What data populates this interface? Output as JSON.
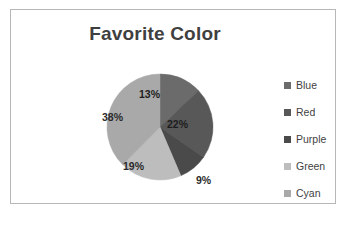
{
  "chart_data": {
    "type": "pie",
    "title": "Favorite Color",
    "categories": [
      "Blue",
      "Red",
      "Purple",
      "Green",
      "Cyan"
    ],
    "values": [
      13,
      22,
      9,
      19,
      38
    ],
    "value_labels": [
      "13%",
      "22%",
      "9%",
      "19%",
      "38%"
    ],
    "unit": "percent",
    "start_angle_deg": 0,
    "direction": "clockwise",
    "legend_position": "right",
    "grid": false,
    "colors": [
      "#6b6b6b",
      "#585858",
      "#4a4a4a",
      "#bdbdbd",
      "#a9a9a9"
    ],
    "label_colors": [
      "#1d1d1d",
      "#1d1d1d",
      "#2b2b2b",
      "#2b2b2b",
      "#2b2b2b"
    ]
  },
  "chart": {
    "title": "Favorite Color",
    "border_color": "#b7b7b7",
    "background": "#ffffff",
    "title_color": "#3f3f3f"
  },
  "legend": {
    "items": [
      {
        "label": "Blue",
        "color": "#6b6b6b",
        "swatch_name": "legend-swatch-blue"
      },
      {
        "label": "Red",
        "color": "#585858",
        "swatch_name": "legend-swatch-red"
      },
      {
        "label": "Purple",
        "color": "#4a4a4a",
        "swatch_name": "legend-swatch-purple"
      },
      {
        "label": "Green",
        "color": "#bdbdbd",
        "swatch_name": "legend-swatch-green"
      },
      {
        "label": "Cyan",
        "color": "#a9a9a9",
        "swatch_name": "legend-swatch-cyan"
      }
    ]
  },
  "pie": {
    "center_x": 65,
    "center_y": 65,
    "radius": 53,
    "slices": [
      {
        "name": "Blue",
        "percent": 13,
        "label": "13%",
        "color": "#6b6b6b",
        "label_x": 44,
        "label_y": 26,
        "on_dark": true
      },
      {
        "name": "Red",
        "percent": 22,
        "label": "22%",
        "color": "#585858",
        "label_x": 72,
        "label_y": 56,
        "on_dark": true
      },
      {
        "name": "Purple",
        "percent": 9,
        "label": "9%",
        "color": "#4a4a4a",
        "label_x": 101,
        "label_y": 112,
        "on_dark": false
      },
      {
        "name": "Green",
        "percent": 19,
        "label": "19%",
        "color": "#bdbdbd",
        "label_x": 28,
        "label_y": 98,
        "on_dark": false
      },
      {
        "name": "Cyan",
        "percent": 38,
        "label": "38%",
        "color": "#a9a9a9",
        "label_x": 7,
        "label_y": 49,
        "on_dark": false
      }
    ]
  }
}
